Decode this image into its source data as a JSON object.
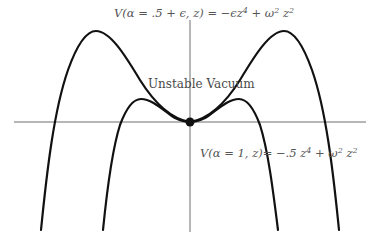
{
  "diagram": {
    "type": "potential-curves",
    "colors": {
      "curve": "#111111",
      "axis": "#6e6e6e",
      "text": "#555555",
      "background": "#ffffff"
    },
    "labels": {
      "top_curve": {
        "lhs": "V(α = .5 + ϵ, z)",
        "eq": " = ",
        "rhs_a": "−ϵz",
        "rhs_a_exp": "4",
        "rhs_b": " + ω",
        "rhs_b_exp": "2",
        "rhs_c": " z",
        "rhs_c_exp": "2"
      },
      "bottom_curve": {
        "lhs": "V(α = 1, z)",
        "eq": "= ",
        "rhs_a": "−.5 z",
        "rhs_a_exp": "4",
        "rhs_b": " + ω",
        "rhs_b_exp": "2",
        "rhs_c": " z",
        "rhs_c_exp": "2"
      },
      "annotation": "Unstable Vacuum"
    },
    "marker": {
      "name": "origin-point",
      "x": 190,
      "y": 122
    },
    "curves": [
      {
        "name": "V(α = .5 + ϵ, z)",
        "expression": "−ϵz^4 + ω^2 z^2",
        "peak_left": [
          95,
          31
        ],
        "peak_right": [
          284,
          31
        ],
        "axis_crossings": [
          55,
          323
        ]
      },
      {
        "name": "V(α = 1, z)",
        "expression": "−.5 z^4 + ω^2 z^2",
        "peak_left": [
          140,
          99
        ],
        "peak_right": [
          238,
          99
        ],
        "axis_crossings": [
          122,
          258
        ]
      }
    ]
  }
}
